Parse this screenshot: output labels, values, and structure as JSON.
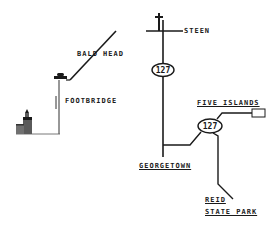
{
  "map": {
    "type": "road-directions-sketch",
    "colors": {
      "background": "#ffffff",
      "ink": "#1a1a1a",
      "lighthouse": "#555555"
    },
    "labels": {
      "steen": "STEEN",
      "bald_head": "BALD HEAD",
      "footbridge": "FOOTBRIDGE",
      "five_islands": "FIVE ISLANDS",
      "georgetown": "GEORGETOWN",
      "reid": "REID",
      "state_park": "STATE PARK"
    },
    "route_shields": [
      {
        "id": "upper",
        "number": "127"
      },
      {
        "id": "lower",
        "number": "127"
      }
    ],
    "icons": [
      "church-cross-icon",
      "car-icon",
      "footbridge-icon",
      "lighthouse-icon",
      "destination-box-icon"
    ]
  }
}
